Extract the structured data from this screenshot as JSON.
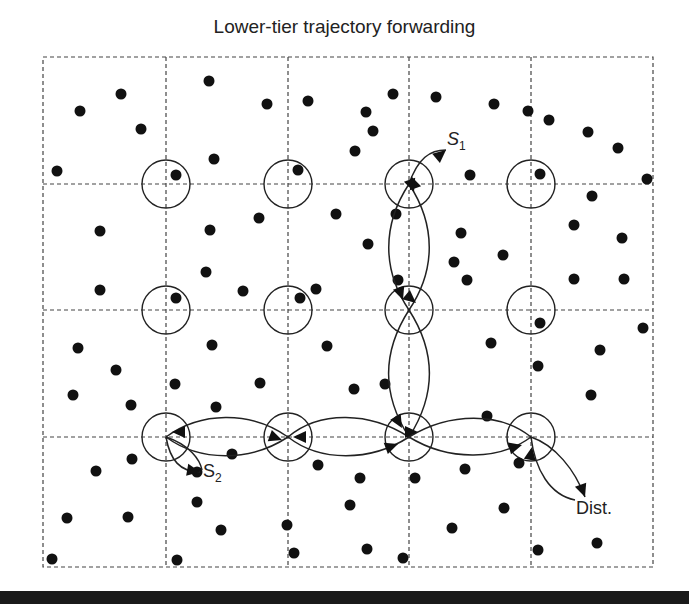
{
  "title": "Lower-tier trajectory forwarding",
  "labels": {
    "s1": "S",
    "s1_sub": "1",
    "s2": "S",
    "s2_sub": "2",
    "dest": "Dist."
  },
  "colors": {
    "ink": "#222222",
    "grid": "#444444",
    "background": "#ffffff"
  },
  "grid": {
    "left": 43,
    "top": 57,
    "right": 653,
    "bottom": 567,
    "vertical_lines": [
      166,
      288,
      409,
      531
    ],
    "horizontal_lines": [
      184,
      310,
      437
    ]
  },
  "grid_points": {
    "radius": 24,
    "centers": [
      [
        166,
        184
      ],
      [
        288,
        184
      ],
      [
        409,
        184
      ],
      [
        531,
        184
      ],
      [
        166,
        310
      ],
      [
        288,
        310
      ],
      [
        409,
        310
      ],
      [
        531,
        310
      ],
      [
        166,
        437
      ],
      [
        288,
        437
      ],
      [
        409,
        437
      ],
      [
        531,
        437
      ]
    ]
  },
  "nodes": [
    [
      80,
      111
    ],
    [
      121,
      94
    ],
    [
      141,
      129
    ],
    [
      57,
      171
    ],
    [
      209,
      81
    ],
    [
      267,
      104
    ],
    [
      308,
      101
    ],
    [
      176,
      175
    ],
    [
      214,
      159
    ],
    [
      298,
      170
    ],
    [
      393,
      94
    ],
    [
      373,
      131
    ],
    [
      355,
      151
    ],
    [
      366,
      112
    ],
    [
      436,
      97
    ],
    [
      494,
      104
    ],
    [
      528,
      111
    ],
    [
      549,
      120
    ],
    [
      588,
      132
    ],
    [
      618,
      148
    ],
    [
      470,
      175
    ],
    [
      540,
      174
    ],
    [
      647,
      179
    ],
    [
      592,
      196
    ],
    [
      396,
      214
    ],
    [
      100,
      231
    ],
    [
      210,
      230
    ],
    [
      259,
      218
    ],
    [
      336,
      214
    ],
    [
      368,
      244
    ],
    [
      461,
      233
    ],
    [
      503,
      255
    ],
    [
      574,
      225
    ],
    [
      622,
      238
    ],
    [
      454,
      262
    ],
    [
      100,
      290
    ],
    [
      206,
      272
    ],
    [
      243,
      291
    ],
    [
      316,
      289
    ],
    [
      398,
      280
    ],
    [
      467,
      280
    ],
    [
      574,
      279
    ],
    [
      624,
      279
    ],
    [
      176,
      298
    ],
    [
      300,
      298
    ],
    [
      540,
      323
    ],
    [
      643,
      328
    ],
    [
      78,
      348
    ],
    [
      212,
      345
    ],
    [
      327,
      346
    ],
    [
      491,
      343
    ],
    [
      600,
      350
    ],
    [
      116,
      370
    ],
    [
      175,
      384
    ],
    [
      260,
      383
    ],
    [
      385,
      384
    ],
    [
      538,
      366
    ],
    [
      591,
      395
    ],
    [
      73,
      395
    ],
    [
      131,
      405
    ],
    [
      216,
      407
    ],
    [
      354,
      389
    ],
    [
      487,
      416
    ],
    [
      132,
      459
    ],
    [
      232,
      454
    ],
    [
      96,
      471
    ],
    [
      197,
      472
    ],
    [
      318,
      465
    ],
    [
      360,
      478
    ],
    [
      415,
      478
    ],
    [
      465,
      469
    ],
    [
      519,
      463
    ],
    [
      67,
      518
    ],
    [
      128,
      517
    ],
    [
      197,
      502
    ],
    [
      221,
      530
    ],
    [
      287,
      525
    ],
    [
      350,
      505
    ],
    [
      452,
      528
    ],
    [
      504,
      508
    ],
    [
      52,
      559
    ],
    [
      177,
      560
    ],
    [
      294,
      553
    ],
    [
      367,
      549
    ],
    [
      403,
      558
    ],
    [
      538,
      550
    ],
    [
      597,
      543
    ]
  ],
  "paths": {
    "s1_loop": "M 409 184 C 418 158, 430 150, 446 150",
    "vertical_up_left": "M 409 310 C 382 270, 382 225, 409 184",
    "vertical_down_right": "M 409 184 C 436 225, 436 270, 409 310",
    "vertical2_up_left": "M 409 437 C 382 395, 382 352, 409 310",
    "vertical2_down_right": "M 409 310 C 436 352, 436 395, 409 437",
    "h1_top": "M 409 437 C 370 412, 320 410, 288 437",
    "h1_bottom": "M 288 437 C 320 462, 370 462, 409 437",
    "h2_top": "M 288 437 C 250 410, 200 412, 166 437",
    "h2_bottom": "M 166 437 C 200 462, 250 462, 288 437",
    "h3_top": "M 409 437 C 450 412, 500 412, 531 437",
    "h3_bottom": "M 531 437 C 500 460, 450 462, 409 437",
    "s2_curve": "M 166 437 C 170 460, 180 472, 200 472",
    "s2_curve2": "M 166 437 C 190 445, 200 460, 202 470",
    "dest_a": "M 531 437 C 555 445, 575 470, 585 497",
    "dest_b": "M 531 437 C 535 470, 550 495, 575 500"
  },
  "arrowheads": [
    {
      "x": 446,
      "y": 150,
      "angle": -40
    },
    {
      "x": 411,
      "y": 176,
      "angle": -110
    },
    {
      "x": 414,
      "y": 192,
      "angle": 70
    },
    {
      "x": 403,
      "y": 300,
      "angle": 70
    },
    {
      "x": 416,
      "y": 303,
      "angle": 40
    },
    {
      "x": 402,
      "y": 428,
      "angle": 60
    },
    {
      "x": 418,
      "y": 432,
      "angle": 0
    },
    {
      "x": 293,
      "y": 437,
      "angle": 180
    },
    {
      "x": 282,
      "y": 440,
      "angle": 20
    },
    {
      "x": 398,
      "y": 444,
      "angle": -20
    },
    {
      "x": 172,
      "y": 432,
      "angle": 180
    },
    {
      "x": 522,
      "y": 445,
      "angle": -15
    },
    {
      "x": 532,
      "y": 447,
      "angle": -80
    },
    {
      "x": 200,
      "y": 472,
      "angle": 10
    },
    {
      "x": 585,
      "y": 497,
      "angle": 70
    }
  ]
}
